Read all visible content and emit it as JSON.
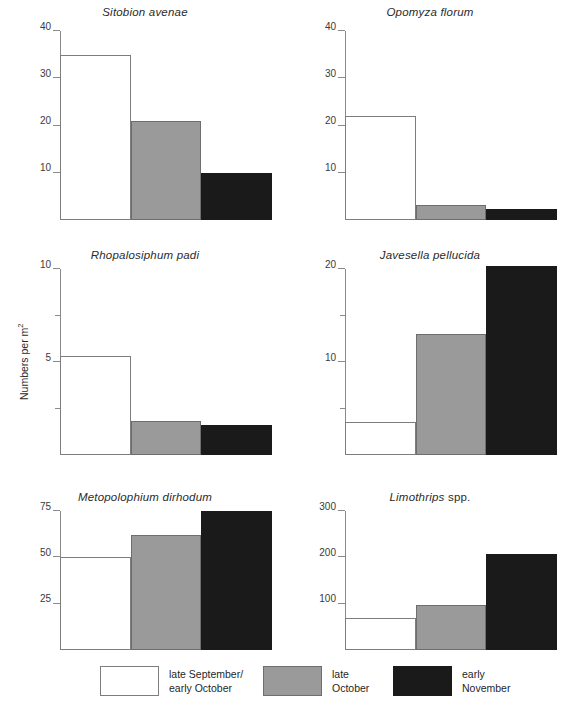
{
  "figure": {
    "ylabel": "Numbers per m",
    "ylabel_sup": "2"
  },
  "legend": {
    "items": [
      {
        "key": "white",
        "label": "late September/\nearly October",
        "color": "#ffffff"
      },
      {
        "key": "gray",
        "label": "late\nOctober",
        "color": "#9a9a9a"
      },
      {
        "key": "black",
        "label": "early\nNovember",
        "color": "#1a1a1a"
      }
    ]
  },
  "chart_data": [
    {
      "type": "bar",
      "id": "sitobion-avenae",
      "title": "Sitobion avenae",
      "title_style": "italic",
      "categories": [
        "late September/early October",
        "late October",
        "early November"
      ],
      "values": [
        35,
        21,
        10
      ],
      "colors": [
        "#ffffff",
        "#9a9a9a",
        "#1a1a1a"
      ],
      "ylim": [
        0,
        40
      ],
      "yticks": [
        10,
        20,
        30,
        40
      ],
      "yticklabels": [
        "10",
        "20",
        "30",
        "40"
      ],
      "yminorticks": [],
      "xlabel": "",
      "ylabel": "Numbers per m2",
      "grid": false
    },
    {
      "type": "bar",
      "id": "opomyza-florum",
      "title": "Opomyza florum",
      "title_style": "italic",
      "categories": [
        "late September/early October",
        "late October",
        "early November"
      ],
      "values": [
        22,
        3.2,
        2.3
      ],
      "colors": [
        "#ffffff",
        "#9a9a9a",
        "#1a1a1a"
      ],
      "ylim": [
        0,
        40
      ],
      "yticks": [
        10,
        20,
        30,
        40
      ],
      "yticklabels": [
        "10",
        "20",
        "30",
        "40"
      ],
      "yminorticks": [],
      "xlabel": "",
      "ylabel": "",
      "grid": false
    },
    {
      "type": "bar",
      "id": "rhopalosiphum-padi",
      "title": "Rhopalosiphum padi",
      "title_style": "italic",
      "categories": [
        "late September/early October",
        "late October",
        "early November"
      ],
      "values": [
        5.3,
        1.85,
        1.6
      ],
      "colors": [
        "#ffffff",
        "#9a9a9a",
        "#1a1a1a"
      ],
      "ylim": [
        0,
        10
      ],
      "yticks": [
        5,
        10
      ],
      "yticklabels": [
        "5",
        "10"
      ],
      "yminorticks": [
        2.5,
        7.5
      ],
      "xlabel": "",
      "ylabel": "Numbers per m2",
      "grid": false
    },
    {
      "type": "bar",
      "id": "javesella-pellucida",
      "title": "Javesella pellucida",
      "title_style": "italic",
      "categories": [
        "late September/early October",
        "late October",
        "early November"
      ],
      "values": [
        3.5,
        13,
        20.3
      ],
      "colors": [
        "#ffffff",
        "#9a9a9a",
        "#1a1a1a"
      ],
      "ylim": [
        0,
        20
      ],
      "yticks": [
        10,
        20
      ],
      "yticklabels": [
        "10",
        "20"
      ],
      "yminorticks": [
        5,
        15
      ],
      "xlabel": "",
      "ylabel": "",
      "grid": false
    },
    {
      "type": "bar",
      "id": "metopolophium-dirhodum",
      "title": "Metopolophium dirhodum",
      "title_style": "italic",
      "categories": [
        "late September/early October",
        "late October",
        "early November"
      ],
      "values": [
        50,
        62,
        75
      ],
      "colors": [
        "#ffffff",
        "#9a9a9a",
        "#1a1a1a"
      ],
      "ylim": [
        0,
        75
      ],
      "yticks": [
        25,
        50,
        75
      ],
      "yticklabels": [
        "25",
        "50",
        "75"
      ],
      "yminorticks": [],
      "xlabel": "",
      "ylabel": "Numbers per m2",
      "grid": false
    },
    {
      "type": "bar",
      "id": "limothrips-spp",
      "title": "Limothrips spp.",
      "title_style": "italic-genus",
      "title_italic_part": "Limothrips",
      "title_roman_part": " spp.",
      "categories": [
        "late September/early October",
        "late October",
        "early November"
      ],
      "values": [
        70,
        97,
        208
      ],
      "colors": [
        "#ffffff",
        "#9a9a9a",
        "#1a1a1a"
      ],
      "ylim": [
        0,
        300
      ],
      "yticks": [
        100,
        200,
        300
      ],
      "yticklabels": [
        "100",
        "200",
        "300"
      ],
      "yminorticks": [],
      "xlabel": "",
      "ylabel": "",
      "grid": false
    }
  ]
}
